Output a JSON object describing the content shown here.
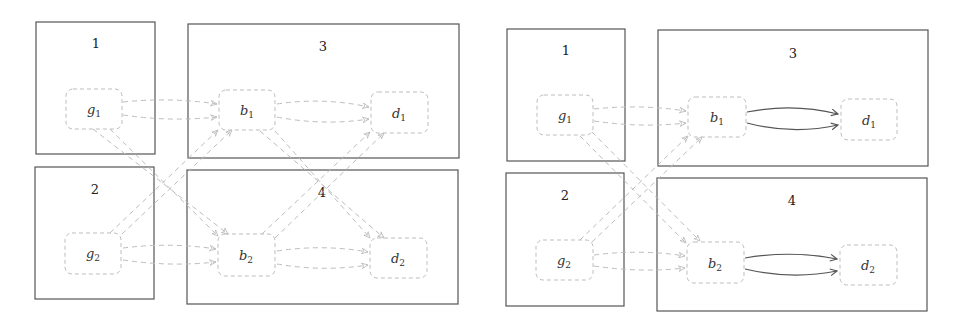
{
  "diagrams": [
    {
      "id": "left",
      "regions": [
        {
          "label": "1",
          "x": 36,
          "y": 22,
          "w": 119,
          "h": 132
        },
        {
          "label": "3",
          "x": 188,
          "y": 24,
          "w": 271,
          "h": 134
        },
        {
          "label": "2",
          "x": 35,
          "y": 167,
          "w": 119,
          "h": 132
        },
        {
          "label": "4",
          "x": 187,
          "y": 170,
          "w": 271,
          "h": 134
        }
      ],
      "nodes": [
        {
          "base": "g",
          "sub": "1",
          "x": 66,
          "y": 89,
          "w": 56,
          "h": 40
        },
        {
          "base": "b",
          "sub": "1",
          "x": 219,
          "y": 90,
          "w": 56,
          "h": 40
        },
        {
          "base": "d",
          "sub": "1",
          "x": 371,
          "y": 92,
          "w": 57,
          "h": 41
        },
        {
          "base": "g",
          "sub": "2",
          "x": 65,
          "y": 233,
          "w": 56,
          "h": 41
        },
        {
          "base": "b",
          "sub": "2",
          "x": 218,
          "y": 234,
          "w": 57,
          "h": 42
        },
        {
          "base": "d",
          "sub": "2",
          "x": 370,
          "y": 238,
          "w": 57,
          "h": 40
        }
      ],
      "edge_style_bd": "dashed"
    },
    {
      "id": "right",
      "regions": [
        {
          "label": "1",
          "x": 507,
          "y": 29,
          "w": 118,
          "h": 132
        },
        {
          "label": "3",
          "x": 658,
          "y": 30,
          "w": 270,
          "h": 136
        },
        {
          "label": "2",
          "x": 506,
          "y": 173,
          "w": 118,
          "h": 133
        },
        {
          "label": "4",
          "x": 657,
          "y": 178,
          "w": 270,
          "h": 133
        }
      ],
      "nodes": [
        {
          "base": "g",
          "sub": "1",
          "x": 537,
          "y": 95,
          "w": 56,
          "h": 40
        },
        {
          "base": "b",
          "sub": "1",
          "x": 688,
          "y": 97,
          "w": 58,
          "h": 40
        },
        {
          "base": "d",
          "sub": "1",
          "x": 841,
          "y": 99,
          "w": 56,
          "h": 41
        },
        {
          "base": "g",
          "sub": "2",
          "x": 536,
          "y": 240,
          "w": 57,
          "h": 40
        },
        {
          "base": "b",
          "sub": "2",
          "x": 687,
          "y": 242,
          "w": 57,
          "h": 41
        },
        {
          "base": "d",
          "sub": "2",
          "x": 840,
          "y": 245,
          "w": 57,
          "h": 40
        }
      ],
      "edge_style_bd": "solid"
    }
  ],
  "colors": {
    "region_border": "#555555",
    "node_border": "#bdbdbd",
    "dashed_edge": "#bcbcbc",
    "solid_edge": "#555555"
  }
}
